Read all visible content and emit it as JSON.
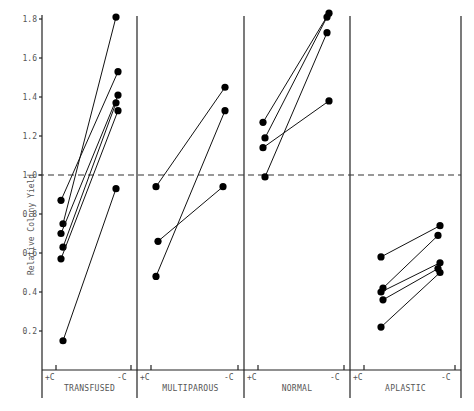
{
  "chart_data": {
    "type": "line",
    "title": "",
    "ylabel": "Relative Colony Yield",
    "xlabel": "",
    "ylim": [
      0,
      1.8
    ],
    "yticks": [
      0.2,
      0.4,
      0.6,
      0.8,
      1.0,
      1.2,
      1.4,
      1.6,
      1.8
    ],
    "ytick_labels": [
      "0.2",
      "0.4",
      "0.6",
      "0.8",
      "1.0",
      "1.2",
      "1.4",
      "1.6",
      "1.8"
    ],
    "reference_line": {
      "y": 1.0,
      "style": "dashed"
    },
    "condition_labels": [
      "+C",
      "-C"
    ],
    "groups": [
      {
        "name": "TRANSFUSED",
        "pairs": [
          [
            0.87,
            1.53
          ],
          [
            0.75,
            1.81
          ],
          [
            0.7,
            1.41
          ],
          [
            0.63,
            1.37
          ],
          [
            0.57,
            1.33
          ],
          [
            0.15,
            0.93
          ]
        ]
      },
      {
        "name": "MULTIPAROUS",
        "pairs": [
          [
            0.94,
            1.45
          ],
          [
            0.66,
            0.94
          ],
          [
            0.48,
            1.33
          ]
        ]
      },
      {
        "name": "NORMAL",
        "pairs": [
          [
            1.27,
            1.83
          ],
          [
            1.19,
            1.81
          ],
          [
            1.14,
            1.38
          ],
          [
            0.99,
            1.73
          ]
        ]
      },
      {
        "name": "APLASTIC",
        "pairs": [
          [
            0.58,
            0.74
          ],
          [
            0.42,
            0.69
          ],
          [
            0.4,
            0.55
          ],
          [
            0.36,
            0.52
          ],
          [
            0.22,
            0.5
          ]
        ]
      }
    ],
    "grid": false,
    "legend": "none"
  }
}
